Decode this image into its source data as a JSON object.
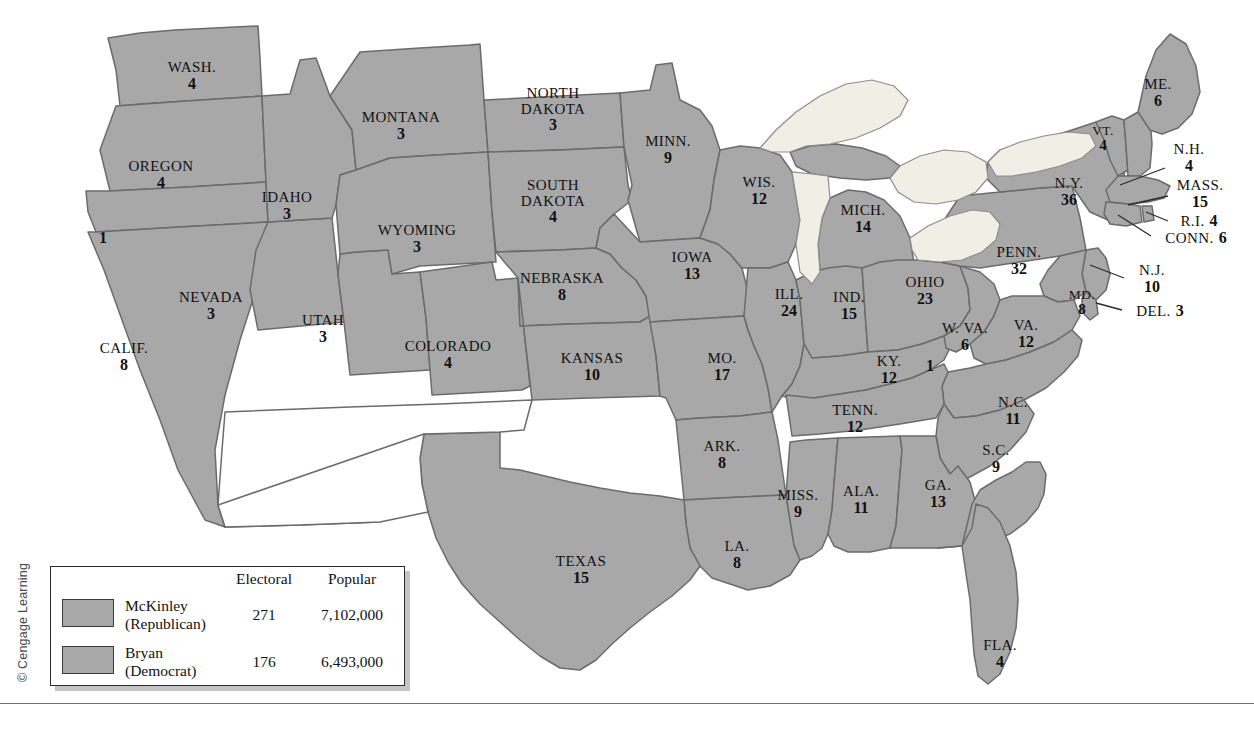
{
  "map": {
    "title": "Election of 1896 electoral map",
    "colors": {
      "state_fill": "#a8a8a8",
      "state_border": "#6b6b6b",
      "outline": "#4a4a4a",
      "lake_fill": "#efefe6",
      "territory_fill": "#ffffff",
      "background": "#ffffff",
      "label_text": "#111111"
    },
    "states": [
      {
        "id": "wash",
        "name": "WASH.",
        "electoral": "4",
        "x": 192,
        "y": 76,
        "size": "normal"
      },
      {
        "id": "oregon",
        "name": "OREGON",
        "electoral": "4",
        "x": 161,
        "y": 175,
        "size": "normal"
      },
      {
        "id": "calif-n",
        "name": "",
        "electoral": "1",
        "x": 103,
        "y": 238,
        "size": "solo"
      },
      {
        "id": "calif",
        "name": "CALIF.",
        "electoral": "8",
        "x": 124,
        "y": 357,
        "size": "normal"
      },
      {
        "id": "nevada",
        "name": "NEVADA",
        "electoral": "3",
        "x": 211,
        "y": 306,
        "size": "normal"
      },
      {
        "id": "idaho",
        "name": "IDAHO",
        "electoral": "3",
        "x": 287,
        "y": 206,
        "size": "normal"
      },
      {
        "id": "utah",
        "name": "UTAH",
        "electoral": "3",
        "x": 323,
        "y": 329,
        "size": "normal"
      },
      {
        "id": "montana",
        "name": "MONTANA",
        "electoral": "3",
        "x": 401,
        "y": 126,
        "size": "normal"
      },
      {
        "id": "wyoming",
        "name": "WYOMING",
        "electoral": "3",
        "x": 417,
        "y": 239,
        "size": "normal"
      },
      {
        "id": "colorado",
        "name": "COLORADO",
        "electoral": "4",
        "x": 448,
        "y": 355,
        "size": "normal"
      },
      {
        "id": "ndakota",
        "name": "NORTH DAKOTA",
        "electoral": "3",
        "x": 553,
        "y": 110,
        "size": "normal"
      },
      {
        "id": "sdakota",
        "name": "SOUTH DAKOTA",
        "electoral": "4",
        "x": 553,
        "y": 202,
        "size": "normal"
      },
      {
        "id": "nebraska",
        "name": "NEBRASKA",
        "electoral": "8",
        "x": 562,
        "y": 287,
        "size": "normal"
      },
      {
        "id": "kansas",
        "name": "KANSAS",
        "electoral": "10",
        "x": 592,
        "y": 367,
        "size": "normal"
      },
      {
        "id": "minn",
        "name": "MINN.",
        "electoral": "9",
        "x": 668,
        "y": 150,
        "size": "normal"
      },
      {
        "id": "iowa",
        "name": "IOWA",
        "electoral": "13",
        "x": 692,
        "y": 266,
        "size": "normal"
      },
      {
        "id": "mo",
        "name": "MO.",
        "electoral": "17",
        "x": 722,
        "y": 367,
        "size": "normal"
      },
      {
        "id": "ark",
        "name": "ARK.",
        "electoral": "8",
        "x": 722,
        "y": 455,
        "size": "normal"
      },
      {
        "id": "la",
        "name": "LA.",
        "electoral": "8",
        "x": 737,
        "y": 555,
        "size": "normal"
      },
      {
        "id": "texas",
        "name": "TEXAS",
        "electoral": "15",
        "x": 581,
        "y": 570,
        "size": "normal"
      },
      {
        "id": "wis",
        "name": "WIS.",
        "electoral": "12",
        "x": 759,
        "y": 191,
        "size": "normal"
      },
      {
        "id": "ill",
        "name": "ILL.",
        "electoral": "24",
        "x": 789,
        "y": 303,
        "size": "normal"
      },
      {
        "id": "mich",
        "name": "MICH.",
        "electoral": "14",
        "x": 863,
        "y": 219,
        "size": "normal"
      },
      {
        "id": "ind",
        "name": "IND.",
        "electoral": "15",
        "x": 849,
        "y": 306,
        "size": "normal"
      },
      {
        "id": "ky",
        "name": "KY.",
        "electoral": "12",
        "x": 889,
        "y": 370,
        "size": "normal"
      },
      {
        "id": "ky-split",
        "name": "",
        "electoral": "1",
        "x": 930,
        "y": 366,
        "size": "solo"
      },
      {
        "id": "miss",
        "name": "MISS.",
        "electoral": "9",
        "x": 798,
        "y": 504,
        "size": "normal"
      },
      {
        "id": "ala",
        "name": "ALA.",
        "electoral": "11",
        "x": 861,
        "y": 500,
        "size": "normal"
      },
      {
        "id": "ga",
        "name": "GA.",
        "electoral": "13",
        "x": 938,
        "y": 494,
        "size": "normal"
      },
      {
        "id": "fla",
        "name": "FLA.",
        "electoral": "4",
        "x": 1000,
        "y": 654,
        "size": "normal"
      },
      {
        "id": "tenn",
        "name": "TENN.",
        "electoral": "12",
        "x": 855,
        "y": 419,
        "size": "normal"
      },
      {
        "id": "ohio",
        "name": "OHIO",
        "electoral": "23",
        "x": 925,
        "y": 291,
        "size": "normal"
      },
      {
        "id": "wva",
        "name": "W. VA.",
        "electoral": "6",
        "x": 965,
        "y": 337,
        "size": "normal"
      },
      {
        "id": "va",
        "name": "VA.",
        "electoral": "12",
        "x": 1026,
        "y": 334,
        "size": "normal"
      },
      {
        "id": "nc",
        "name": "N.C.",
        "electoral": "11",
        "x": 1013,
        "y": 411,
        "size": "normal"
      },
      {
        "id": "sc",
        "name": "S.C.",
        "electoral": "9",
        "x": 996,
        "y": 459,
        "size": "normal"
      },
      {
        "id": "penn",
        "name": "PENN.",
        "electoral": "32",
        "x": 1019,
        "y": 261,
        "size": "normal"
      },
      {
        "id": "ny",
        "name": "N.Y.",
        "electoral": "36",
        "x": 1069,
        "y": 192,
        "size": "normal"
      },
      {
        "id": "vt",
        "name": "VT.",
        "electoral": "4",
        "x": 1103,
        "y": 139,
        "size": "sm"
      },
      {
        "id": "me",
        "name": "ME.",
        "electoral": "6",
        "x": 1158,
        "y": 93,
        "size": "normal"
      },
      {
        "id": "md",
        "name": "MD.",
        "electoral": "8",
        "x": 1082,
        "y": 303,
        "size": "sm"
      }
    ],
    "callouts": [
      {
        "id": "nh",
        "name": "N.H.",
        "electoral": "4",
        "x": 1189,
        "y": 158,
        "layout": "stacked",
        "line": [
          1165,
          168,
          1120,
          185
        ]
      },
      {
        "id": "mass",
        "name": "MASS.",
        "electoral": "15",
        "x": 1200,
        "y": 194,
        "layout": "stacked",
        "line": [
          1168,
          196,
          1128,
          205
        ]
      },
      {
        "id": "ri",
        "name": "R.I.",
        "electoral": "4",
        "x": 1199,
        "y": 221,
        "layout": "inline",
        "line": [
          1168,
          221,
          1146,
          212
        ]
      },
      {
        "id": "conn",
        "name": "CONN.",
        "electoral": "6",
        "x": 1196,
        "y": 238,
        "layout": "inline",
        "line": [
          1151,
          236,
          1118,
          215
        ]
      },
      {
        "id": "nj",
        "name": "N.J.",
        "electoral": "10",
        "x": 1152,
        "y": 279,
        "layout": "stacked",
        "line": [
          1124,
          278,
          1090,
          265
        ]
      },
      {
        "id": "del",
        "name": "DEL.",
        "electoral": "3",
        "x": 1160,
        "y": 311,
        "layout": "inline",
        "line": [
          1122,
          310,
          1096,
          303
        ]
      }
    ]
  },
  "legend": {
    "headers": {
      "electoral": "Electoral",
      "popular": "Popular"
    },
    "rows": [
      {
        "candidate": "McKinley",
        "party": "(Republican)",
        "electoral": "271",
        "popular": "7,102,000",
        "swatch": "#a8a8a8"
      },
      {
        "candidate": "Bryan",
        "party": "(Democrat)",
        "electoral": "176",
        "popular": "6,493,000",
        "swatch": "#a8a8a8"
      }
    ]
  },
  "copyright": "© Cengage Learning"
}
